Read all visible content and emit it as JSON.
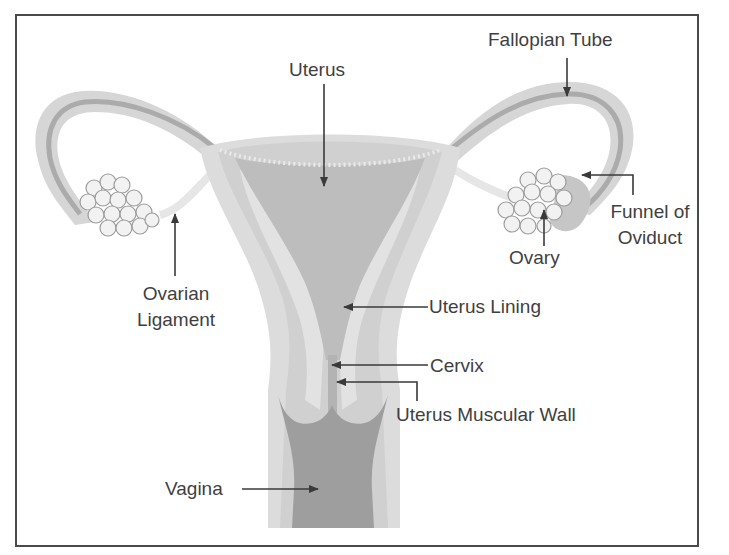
{
  "diagram": {
    "colors": {
      "frame": "#4a4a4a",
      "text": "#3f3f3f",
      "arrow": "#3a3a3a",
      "tissue_light": "#dedede",
      "tissue_mid": "#cfcfcf",
      "lining": "#b9b9b9",
      "cavity_dark": "#9c9c9c",
      "tube_dark": "#a8a8a8",
      "ovary_fill": "#f2f2f2",
      "ovary_stroke": "#9a9a9a"
    },
    "labels": {
      "uterus": "Uterus",
      "fallopian_tube": "Fallopian Tube",
      "funnel_of_oviduct_line1": "Funnel of",
      "funnel_of_oviduct_line2": "Oviduct",
      "ovary": "Ovary",
      "ovarian_ligament_line1": "Ovarian",
      "ovarian_ligament_line2": "Ligament",
      "uterus_lining": "Uterus Lining",
      "cervix": "Cervix",
      "uterus_muscular_wall": "Uterus Muscular Wall",
      "vagina": "Vagina"
    }
  }
}
